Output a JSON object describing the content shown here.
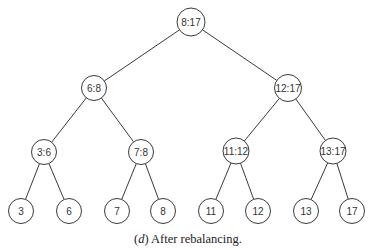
{
  "diagram": {
    "type": "binary-tree",
    "nodes": [
      {
        "id": "n0",
        "label": "8:17",
        "x": 191,
        "y": 22,
        "r": 14
      },
      {
        "id": "n1",
        "label": "6:8",
        "x": 94,
        "y": 88,
        "r": 12.5
      },
      {
        "id": "n2",
        "label": "12:17",
        "x": 288,
        "y": 88,
        "r": 13.5
      },
      {
        "id": "n3",
        "label": "3:6",
        "x": 44,
        "y": 152,
        "r": 12.5
      },
      {
        "id": "n4",
        "label": "7:8",
        "x": 141,
        "y": 152,
        "r": 12.5
      },
      {
        "id": "n5",
        "label": "11:12",
        "x": 236,
        "y": 151,
        "r": 13
      },
      {
        "id": "n6",
        "label": "13:17",
        "x": 333,
        "y": 151,
        "r": 13
      },
      {
        "id": "n7",
        "label": "3",
        "x": 21,
        "y": 211,
        "r": 12.5
      },
      {
        "id": "n8",
        "label": "6",
        "x": 69,
        "y": 211,
        "r": 12.5
      },
      {
        "id": "n9",
        "label": "7",
        "x": 117,
        "y": 211,
        "r": 12.5
      },
      {
        "id": "n10",
        "label": "8",
        "x": 163,
        "y": 211,
        "r": 12.5
      },
      {
        "id": "n11",
        "label": "11",
        "x": 211,
        "y": 211,
        "r": 12.5
      },
      {
        "id": "n12",
        "label": "12",
        "x": 258,
        "y": 211,
        "r": 12.5
      },
      {
        "id": "n13",
        "label": "13",
        "x": 306,
        "y": 211,
        "r": 12.5
      },
      {
        "id": "n14",
        "label": "17",
        "x": 352,
        "y": 211,
        "r": 12.5
      }
    ],
    "edges": [
      [
        "n0",
        "n1"
      ],
      [
        "n0",
        "n2"
      ],
      [
        "n1",
        "n3"
      ],
      [
        "n1",
        "n4"
      ],
      [
        "n2",
        "n5"
      ],
      [
        "n2",
        "n6"
      ],
      [
        "n3",
        "n7"
      ],
      [
        "n3",
        "n8"
      ],
      [
        "n4",
        "n9"
      ],
      [
        "n4",
        "n10"
      ],
      [
        "n5",
        "n11"
      ],
      [
        "n5",
        "n12"
      ],
      [
        "n6",
        "n13"
      ],
      [
        "n6",
        "n14"
      ]
    ]
  },
  "caption": {
    "tag": "(d)",
    "tag_letter": "d",
    "text": "After rebalancing."
  }
}
